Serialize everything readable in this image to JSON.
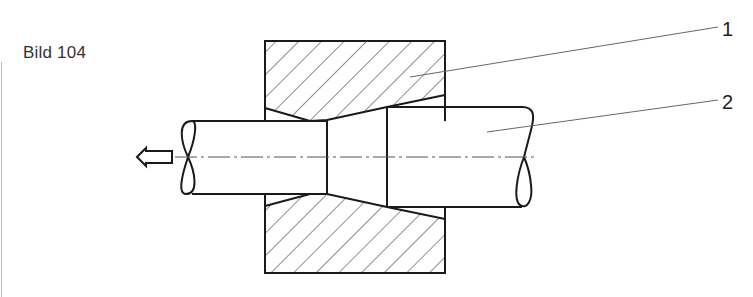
{
  "figure": {
    "caption": "Bild 104",
    "labels": [
      {
        "id": "1",
        "text": "1",
        "refers_to": "die"
      },
      {
        "id": "2",
        "text": "2",
        "refers_to": "rod"
      }
    ],
    "direction_arrow": "arrow-left-icon",
    "colors": {
      "line": "#1a1a1a",
      "hatch": "#333333",
      "leader": "#666666",
      "text": "#333333"
    }
  }
}
